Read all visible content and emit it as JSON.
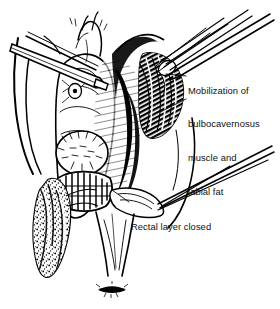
{
  "figure": {
    "style": "black-and-white pen-and-ink surgical line drawing",
    "background_color": "#ffffff",
    "ink_color": "#000000",
    "text_color": "#111111",
    "width": 280,
    "height": 309
  },
  "annotations": [
    {
      "name": "mobilization-label",
      "lines": [
        "Mobilization of",
        "bulbocavernosus",
        "muscle and",
        "labial fat"
      ],
      "x": 188,
      "y": 62,
      "leader_lines": 2
    },
    {
      "name": "rectal-layer-label",
      "lines": [
        "Rectal layer closed"
      ],
      "x": 131,
      "y": 198,
      "leader_lines": 1
    }
  ],
  "scene_parts": [
    {
      "name": "left-thigh-outline",
      "description": "patient left thigh contour at far left of field"
    },
    {
      "name": "right-thigh-outline",
      "description": "patient right thigh contour at right of field"
    },
    {
      "name": "upper-retractor-blade",
      "description": "flat retractor blade entering from upper left across labia"
    },
    {
      "name": "lower-right-retractor-blade",
      "description": "retractor blade entering from right at mid field"
    },
    {
      "name": "forceps-upper-right",
      "description": "pair of tissue forceps / clamps entering from upper right"
    },
    {
      "name": "labial-fat-flap",
      "description": "mobilized bulbocavernosus muscle and labial fat pad, stippled fatty texture, lying to the left of the vaginal introitus"
    },
    {
      "name": "flap-donor-bed",
      "description": "dissected labial donor bed with hatched shading, upper right of introitus"
    },
    {
      "name": "vaginal-introitus",
      "description": "open vaginal introitus retracted in the midline"
    },
    {
      "name": "rectal-suture-line",
      "description": "closed rectal layer shown as a row of interrupted sutures"
    },
    {
      "name": "perineal-body",
      "description": "perineum between introitus and anus"
    },
    {
      "name": "anus",
      "description": "puckered anal verge at lower midline"
    }
  ]
}
